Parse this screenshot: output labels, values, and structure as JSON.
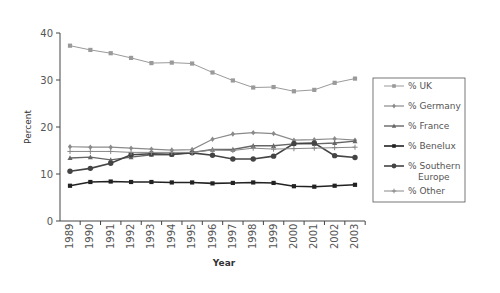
{
  "chart_data": {
    "type": "line",
    "title": "",
    "xlabel": "Year",
    "ylabel": "Percent",
    "ylim": [
      0,
      40
    ],
    "yticks": [
      0,
      10,
      20,
      30,
      40
    ],
    "grid": false,
    "legend_position": "right",
    "x": [
      "1989",
      "1990",
      "1991",
      "1992",
      "1993",
      "1994",
      "1995",
      "1996",
      "1997",
      "1998",
      "1999",
      "2000",
      "2001",
      "2002",
      "2003"
    ],
    "series": [
      {
        "name": "% UK",
        "marker": "square",
        "color": "#9a9a9a",
        "width": 1,
        "values": [
          37.3,
          36.4,
          35.7,
          34.7,
          33.6,
          33.7,
          33.5,
          31.6,
          29.9,
          28.4,
          28.5,
          27.6,
          27.9,
          29.4,
          30.3
        ]
      },
      {
        "name": "% Germany",
        "marker": "diamond",
        "color": "#8a8a8a",
        "width": 1.2,
        "values": [
          15.8,
          15.7,
          15.7,
          15.5,
          15.3,
          15.1,
          15.2,
          17.4,
          18.5,
          18.8,
          18.6,
          17.2,
          17.3,
          17.5,
          17.2
        ]
      },
      {
        "name": "% France",
        "marker": "triangle",
        "color": "#666666",
        "width": 1.4,
        "values": [
          13.4,
          13.6,
          13.0,
          13.6,
          14.1,
          14.1,
          14.6,
          15.2,
          15.2,
          16.0,
          16.0,
          16.4,
          16.4,
          16.6,
          17.0
        ]
      },
      {
        "name": "% Benelux",
        "marker": "square",
        "color": "#222222",
        "width": 1.6,
        "values": [
          7.5,
          8.3,
          8.4,
          8.3,
          8.3,
          8.2,
          8.2,
          8.0,
          8.1,
          8.2,
          8.1,
          7.4,
          7.3,
          7.5,
          7.7
        ]
      },
      {
        "name": "% Southern Europe",
        "marker": "circle",
        "color": "#444444",
        "width": 1.6,
        "values": [
          10.6,
          11.2,
          12.3,
          14.1,
          14.3,
          14.2,
          14.5,
          14.0,
          13.2,
          13.2,
          13.8,
          16.5,
          16.6,
          13.9,
          13.5
        ]
      },
      {
        "name": "% Other",
        "marker": "plus",
        "color": "#888888",
        "width": 1,
        "values": [
          14.8,
          14.8,
          14.8,
          14.6,
          14.6,
          14.6,
          14.6,
          15.1,
          15.0,
          15.5,
          15.3,
          15.4,
          15.5,
          15.6,
          15.7
        ]
      }
    ]
  },
  "legend": {
    "items": [
      {
        "label": "% UK"
      },
      {
        "label": "% Germany"
      },
      {
        "label": "% France"
      },
      {
        "label": "% Benelux"
      },
      {
        "label": "% Southern",
        "label2": "Europe"
      },
      {
        "label": "% Other"
      }
    ]
  }
}
